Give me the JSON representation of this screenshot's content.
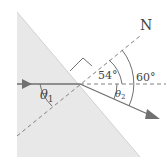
{
  "diagram": {
    "normal_label": "N",
    "angle_54": "54°",
    "angle_60": "60°",
    "theta1": "θ",
    "theta1_sub": "1",
    "theta2": "θ",
    "theta2_sub": "2"
  },
  "colors": {
    "medium_fill": "#e6e6e6",
    "line": "#707070",
    "dashed": "#808080",
    "text": "#444444"
  }
}
